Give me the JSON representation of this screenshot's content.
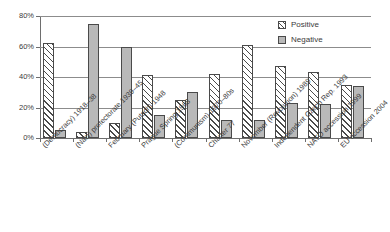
{
  "chart_data": {
    "type": "bar",
    "title": "",
    "subtitle": "",
    "xlabel": "",
    "ylabel": "",
    "ylim": [
      0,
      80
    ],
    "ytick_labels": [
      "0%",
      "20%",
      "40%",
      "60%",
      "80%"
    ],
    "ytick_values": [
      0,
      20,
      40,
      60,
      80
    ],
    "grid": true,
    "legend_position": "top-right",
    "categories": [
      "(Democracy) 1918–38",
      "(Nazi) protectorate 1939–45",
      "February (Putsch) 1948",
      "Prague Spring 1968",
      "(Communism) 1970–80s",
      "Charter 77",
      "November (Revolution) 1989",
      "Independent Czech Rep. 1993",
      "NATO accession 1999",
      "EU accession 2004"
    ],
    "series": [
      {
        "name": "Positive",
        "fill": "hatched",
        "values": [
          62,
          4,
          10,
          41,
          25,
          42,
          61,
          47,
          43,
          35
        ]
      },
      {
        "name": "Negative",
        "fill": "solid-gray",
        "values": [
          5,
          75,
          60,
          15,
          30,
          12,
          12,
          23,
          22,
          34
        ]
      }
    ]
  },
  "legend": {
    "items": [
      {
        "label": "Positive",
        "swatch": "hatched-swatch"
      },
      {
        "label": "Negative",
        "swatch": "gray-swatch"
      }
    ]
  },
  "colors": {
    "negative_fill": "#b9b9b9",
    "positive_fill": "#ffffff",
    "bar_outline": "#4a4a4a",
    "gridline": "#8c8c8c",
    "axis": "#6e6e6e",
    "text": "#3b3b3b",
    "background": "#ffffff"
  }
}
